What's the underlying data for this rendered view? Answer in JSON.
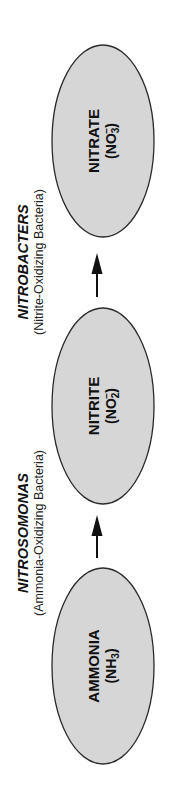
{
  "diagram": {
    "type": "nitrogen-nitrification-flow",
    "orientation": "rotated-90-ccw",
    "colors": {
      "ellipse_fill": "#d6d6d6",
      "ellipse_stroke": "#2a2a2a",
      "text": "#111111",
      "background": "#ffffff"
    },
    "nodes": [
      {
        "id": "ammonia",
        "name": "AMMONIA",
        "formula_prefix": "(NH",
        "formula_subscript": "3",
        "formula_superscript": "",
        "formula_suffix": ")"
      },
      {
        "id": "nitrite",
        "name": "NITRITE",
        "formula_prefix": "(NO",
        "formula_subscript": "2",
        "formula_superscript": "−",
        "formula_suffix": ")"
      },
      {
        "id": "nitrate",
        "name": "NITRATE",
        "formula_prefix": "(NO",
        "formula_subscript": "3",
        "formula_superscript": "−",
        "formula_suffix": ")"
      }
    ],
    "transitions": [
      {
        "from": "ammonia",
        "to": "nitrite",
        "bacteria": "NITROSOMONAS",
        "description": "(Ammonia-Oxidizing Bacteria)"
      },
      {
        "from": "nitrite",
        "to": "nitrate",
        "bacteria": "NITROBACTERS",
        "description": "(Nitrite-Oxidizing Bacteria)"
      }
    ]
  }
}
